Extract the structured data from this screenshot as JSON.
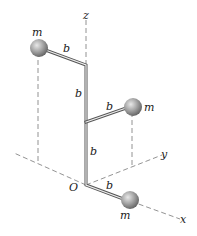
{
  "figure": {
    "axes": {
      "z_label": "z",
      "y_label": "y",
      "x_label": "x",
      "origin_label": "O"
    },
    "masses": [
      {
        "id": "upper",
        "label": "m"
      },
      {
        "id": "middle",
        "label": "m"
      },
      {
        "id": "lower",
        "label": "m"
      }
    ],
    "segments": [
      {
        "id": "upper-arm",
        "label": "b"
      },
      {
        "id": "upper-vertical",
        "label": "b"
      },
      {
        "id": "middle-arm",
        "label": "b"
      },
      {
        "id": "lower-vertical",
        "label": "b"
      },
      {
        "id": "lower-arm",
        "label": "b"
      }
    ],
    "colors": {
      "rod": "#555555",
      "sphere": "#9a9a9a",
      "axis": "#777777"
    }
  }
}
